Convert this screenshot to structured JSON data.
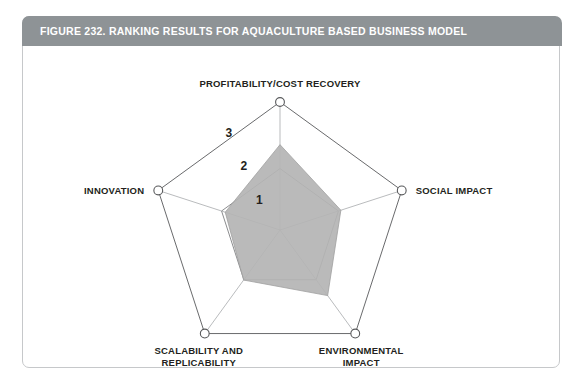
{
  "figure": {
    "title": "FIGURE 232. RANKING RESULTS FOR AQUACULTURE BASED BUSINESS MODEL",
    "header_color": "#8e9396",
    "border_color": "#c6c8ca",
    "background_color": "#ffffff"
  },
  "chart_data": {
    "type": "radar",
    "title": "FIGURE 232. RANKING RESULTS FOR AQUACULTURE BASED BUSINESS MODEL",
    "categories": [
      "PROFITABILITY/COST RECOVERY",
      "SOCIAL IMPACT",
      "ENVIRONMENTAL IMPACT",
      "SCALABILITY AND REPLICABILITY",
      "INNOVATION"
    ],
    "category_lines": [
      [
        "PROFITABILITY/COST RECOVERY"
      ],
      [
        "SOCIAL IMPACT"
      ],
      [
        "ENVIRONMENTAL",
        "IMPACT"
      ],
      [
        "SCALABILITY AND",
        "REPLICABILITY"
      ],
      [
        "INNOVATION"
      ]
    ],
    "series": [
      {
        "name": "Aquaculture Based Business Model",
        "values": [
          2.0,
          1.5,
          1.9,
          1.45,
          1.35
        ],
        "fill_color": "#b4b4b4",
        "stroke_color": "#a0a0a0"
      }
    ],
    "rlim": [
      0,
      3
    ],
    "rticks": [
      1,
      2,
      3
    ],
    "rtick_labels": [
      "1",
      "2",
      "3"
    ],
    "grid": true,
    "grid_shape": "polygon",
    "legend": "none",
    "xlabel": "",
    "ylabel": ""
  },
  "geometry": {
    "center_x": 257,
    "center_y": 183,
    "outer_radius": 128,
    "inner_ring_radius_ratio": 0.48,
    "start_angle_deg": -90
  }
}
